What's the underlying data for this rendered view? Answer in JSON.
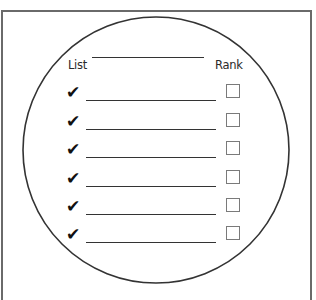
{
  "worksheet": {
    "list_label": "List",
    "rank_label": "Rank",
    "title_line": "",
    "items": [
      {
        "check_icon": "check-mark-icon",
        "text": "",
        "rank_checked": false
      },
      {
        "check_icon": "check-mark-icon",
        "text": "",
        "rank_checked": false
      },
      {
        "check_icon": "check-mark-icon",
        "text": "",
        "rank_checked": false
      },
      {
        "check_icon": "check-mark-icon",
        "text": "",
        "rank_checked": false
      },
      {
        "check_icon": "check-mark-icon",
        "text": "",
        "rank_checked": false
      },
      {
        "check_icon": "check-mark-icon",
        "text": "",
        "rank_checked": false
      }
    ],
    "check_glyph": "✔"
  }
}
